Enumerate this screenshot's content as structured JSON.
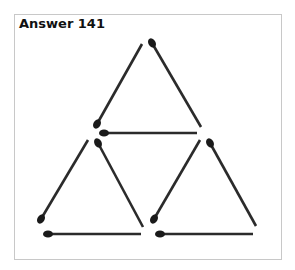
{
  "title": "Answer 141",
  "colors": {
    "stick": "#2b2b2b",
    "head": "#1a1a1a",
    "frame": "#c8c8c8"
  },
  "matchsticks": [
    {
      "name": "top-left",
      "head": [
        97,
        124
      ],
      "tail": [
        142,
        44
      ]
    },
    {
      "name": "top-right",
      "head": [
        152,
        43
      ],
      "tail": [
        201,
        127
      ]
    },
    {
      "name": "middle-horizontal",
      "head": [
        104,
        133
      ],
      "tail": [
        197,
        133
      ]
    },
    {
      "name": "lower-left-left",
      "head": [
        41,
        219
      ],
      "tail": [
        88,
        140
      ]
    },
    {
      "name": "lower-left-right",
      "head": [
        98,
        143
      ],
      "tail": [
        143,
        227
      ]
    },
    {
      "name": "lower-right-left",
      "head": [
        154,
        219
      ],
      "tail": [
        200,
        140
      ]
    },
    {
      "name": "lower-right-right",
      "head": [
        210,
        143
      ],
      "tail": [
        256,
        226
      ]
    },
    {
      "name": "bottom-left",
      "head": [
        48,
        234
      ],
      "tail": [
        141,
        234
      ]
    },
    {
      "name": "bottom-right",
      "head": [
        160,
        234
      ],
      "tail": [
        253,
        234
      ]
    }
  ]
}
